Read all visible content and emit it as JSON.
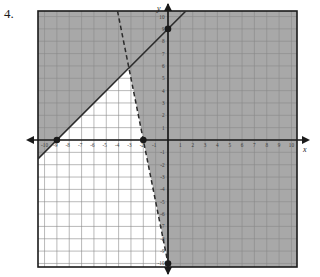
{
  "problem": {
    "number": "4."
  },
  "axes": {
    "x_label": "x",
    "y_label": "y",
    "x_ticks": [
      "-10",
      "-9",
      "-8",
      "-7",
      "-6",
      "-5",
      "-4",
      "-3",
      "-2",
      "-1",
      "1",
      "2",
      "3",
      "4",
      "5",
      "6",
      "7",
      "8",
      "9",
      "10"
    ],
    "y_ticks": [
      "10",
      "9",
      "8",
      "7",
      "6",
      "5",
      "4",
      "3",
      "2",
      "1",
      "-1",
      "-2",
      "-3",
      "-4",
      "-5",
      "-6",
      "-7",
      "-8",
      "-9",
      "-10"
    ]
  },
  "colors": {
    "shade": "#a8a8a8",
    "unshaded": "#ffffff",
    "grid_line": "#8a8a8a",
    "axis": "#1a1a1a",
    "line": "#2b2b2b",
    "border": "#1a1a1a",
    "tick_text": "#3a3a3a"
  },
  "chart_data": {
    "type": "line",
    "title": "",
    "xlabel": "x",
    "ylabel": "y",
    "xlim": [
      -10.5,
      10.5
    ],
    "ylim": [
      -10.5,
      10.5
    ],
    "grid": true,
    "legend": "none",
    "series": [
      {
        "name": "boundary-solid",
        "style": "solid",
        "equation": "y = x + 9",
        "slope": 1,
        "intercept": 9,
        "x_intercept": -9,
        "points": [
          {
            "x": -9,
            "y": 0,
            "marked": true
          },
          {
            "x": 0,
            "y": 9,
            "marked": true
          }
        ],
        "shade_side": "above-left"
      },
      {
        "name": "boundary-dashed",
        "style": "dashed",
        "equation": "y = -5x - 10",
        "slope": -5,
        "intercept": -10,
        "x_intercept": -2,
        "points": [
          {
            "x": -2,
            "y": 0,
            "marked": true
          },
          {
            "x": 0,
            "y": -10,
            "marked": true
          }
        ],
        "shade_side": "right"
      }
    ],
    "intersection": {
      "x": -3.1667,
      "y": 5.8333
    },
    "unshaded_region": "triangular wedge below y=x+9 and left of y=-5x-10",
    "annotations": [
      {
        "text": "4.",
        "kind": "problem-number"
      }
    ]
  }
}
